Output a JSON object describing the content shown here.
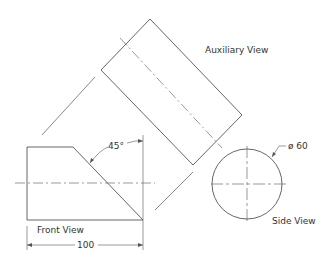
{
  "drawing": {
    "labels": {
      "auxiliary_view": "Auxiliary View",
      "front_view": "Front View",
      "side_view": "Side View"
    },
    "dimensions": {
      "angle": "45°",
      "width": "100",
      "diameter": "ø 60"
    },
    "colors": {
      "line": "#555555",
      "background": "#ffffff"
    }
  }
}
